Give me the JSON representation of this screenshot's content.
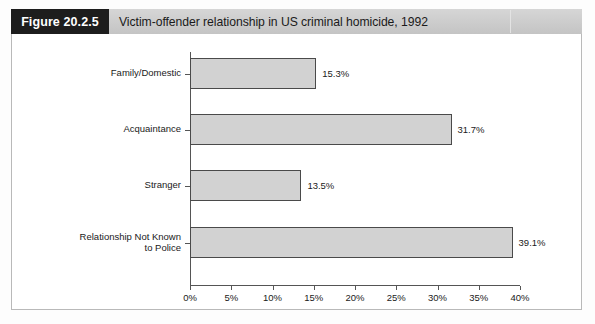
{
  "header": {
    "tag": "Figure 20.2.5",
    "title": "Victim-offender relationship in US criminal homicide, 1992"
  },
  "chart_data": {
    "type": "bar",
    "orientation": "horizontal",
    "title": "Victim-offender relationship in US criminal homicide, 1992",
    "xlabel": "",
    "ylabel": "",
    "categories": [
      "Family/Domestic",
      "Acquaintance",
      "Stranger",
      "Relationship Not Known to Police"
    ],
    "category_lines": [
      [
        "Family/Domestic"
      ],
      [
        "Acquaintance"
      ],
      [
        "Stranger"
      ],
      [
        "Relationship Not Known",
        "to Police"
      ]
    ],
    "values": [
      15.3,
      31.7,
      13.5,
      39.1
    ],
    "value_labels": [
      "15.3%",
      "31.7%",
      "13.5%",
      "39.1%"
    ],
    "xlim": [
      0,
      40
    ],
    "xticks": [
      0,
      5,
      10,
      15,
      20,
      25,
      30,
      35,
      40
    ],
    "xtick_labels": [
      "0%",
      "5%",
      "10%",
      "15%",
      "20%",
      "25%",
      "30%",
      "35%",
      "40%"
    ],
    "grid": false,
    "legend": false,
    "bar_color": "#d2d2d2",
    "bar_border_color": "#4a4a4a",
    "axis_color": "#555555"
  }
}
